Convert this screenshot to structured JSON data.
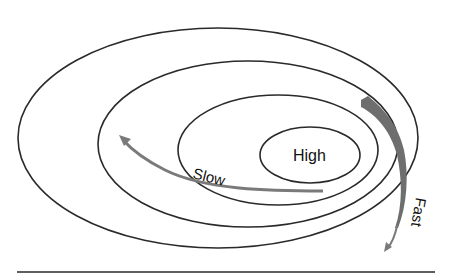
{
  "diagram": {
    "labels": {
      "center": "High",
      "slow": "Slow",
      "fast": "Fast"
    },
    "contours": [
      {
        "name": "contour-outer",
        "cx": 218,
        "cy": 138,
        "rx": 200,
        "ry": 110
      },
      {
        "name": "contour-second",
        "cx": 248,
        "cy": 144,
        "rx": 150,
        "ry": 83
      },
      {
        "name": "contour-third",
        "cx": 278,
        "cy": 150,
        "rx": 100,
        "ry": 55
      },
      {
        "name": "contour-high",
        "cx": 310,
        "cy": 155,
        "rx": 50,
        "ry": 28
      }
    ],
    "arrows": [
      {
        "name": "slow-flow-arrow",
        "direction": "leftward-up",
        "label": "Slow"
      },
      {
        "name": "fast-flow-arrow",
        "direction": "downward",
        "label": "Fast"
      }
    ],
    "colors": {
      "contour": "#2a2a2a",
      "flow": "#7a7a7a",
      "background": "#ffffff"
    }
  }
}
